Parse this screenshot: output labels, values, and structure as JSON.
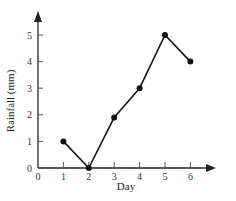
{
  "chart_data": {
    "type": "line",
    "title": "",
    "xlabel": "Day",
    "ylabel": "Rainfall (mm)",
    "x": [
      1,
      2,
      3,
      4,
      5,
      6
    ],
    "series": [
      {
        "name": "Rainfall",
        "values": [
          1,
          0,
          1.9,
          3,
          5,
          4
        ]
      }
    ],
    "xticks": [
      "0",
      "1",
      "2",
      "3",
      "4",
      "5",
      "6"
    ],
    "yticks": [
      "0",
      "1",
      "2",
      "3",
      "4",
      "5"
    ],
    "xlim": [
      0,
      7
    ],
    "ylim": [
      0,
      6
    ],
    "grid": false,
    "legend": "none",
    "marker": "filled-circle",
    "color": "#111111"
  }
}
